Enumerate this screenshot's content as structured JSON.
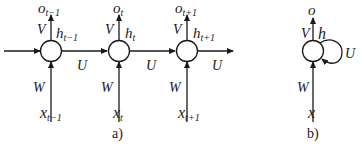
{
  "diagram_a": {
    "caption": "a)",
    "input_arrow": true,
    "steps": [
      {
        "output": "o",
        "output_sub": "t−1",
        "hidden": "h",
        "hidden_sub": "t−1",
        "input": "x",
        "input_sub": "t−1",
        "V": "V",
        "W": "W",
        "U": "U"
      },
      {
        "output": "o",
        "output_sub": "t",
        "hidden": "h",
        "hidden_sub": "t",
        "input": "x",
        "input_sub": "t",
        "V": "V",
        "W": "W",
        "U": "U"
      },
      {
        "output": "o",
        "output_sub": "t+1",
        "hidden": "h",
        "hidden_sub": "t+1",
        "input": "x",
        "input_sub": "t+1",
        "V": "V",
        "W": "W",
        "U": "U"
      }
    ]
  },
  "diagram_b": {
    "caption": "b)",
    "output": "o",
    "hidden": "h",
    "input": "x",
    "V": "V",
    "W": "W",
    "U": "U"
  },
  "colors": {
    "stroke": "#1a1a1a",
    "background": "#ffffff"
  }
}
